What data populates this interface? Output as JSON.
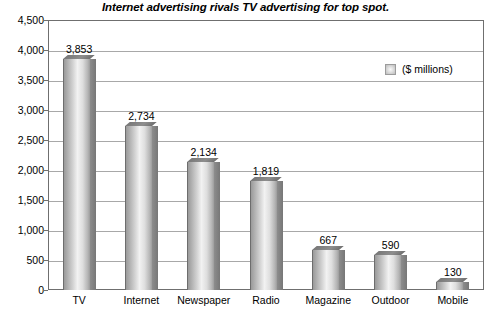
{
  "chart_data": {
    "type": "bar",
    "title": "Internet advertising rivals TV advertising for top spot.",
    "xlabel": "",
    "ylabel": "",
    "ylim": [
      0,
      4500
    ],
    "ytick_step": 500,
    "grid": true,
    "legend_position": "inside-top-right",
    "legend": [
      "($ millions)"
    ],
    "categories": [
      "TV",
      "Internet",
      "Newspaper",
      "Radio",
      "Magazine",
      "Outdoor",
      "Mobile"
    ],
    "values": [
      3853,
      2734,
      2134,
      1819,
      667,
      590,
      130
    ],
    "value_labels": [
      "3,853",
      "2,734",
      "2,134",
      "1,819",
      "667",
      "590",
      "130"
    ],
    "ytick_labels": [
      "4,500",
      "4,000",
      "3,500",
      "3,000",
      "2,500",
      "2,000",
      "1,500",
      "1,000",
      "500",
      "0"
    ],
    "ytick_values": [
      4500,
      4000,
      3500,
      3000,
      2500,
      2000,
      1500,
      1000,
      500,
      0
    ],
    "colors": {
      "bar_light": "#f2f2f2",
      "bar_mid": "#b4b4b4",
      "bar_dark": "#777777",
      "frame": "#6f6f6f",
      "gridline": "#a8a8a8",
      "text": "#000000",
      "background": "#ffffff"
    }
  }
}
